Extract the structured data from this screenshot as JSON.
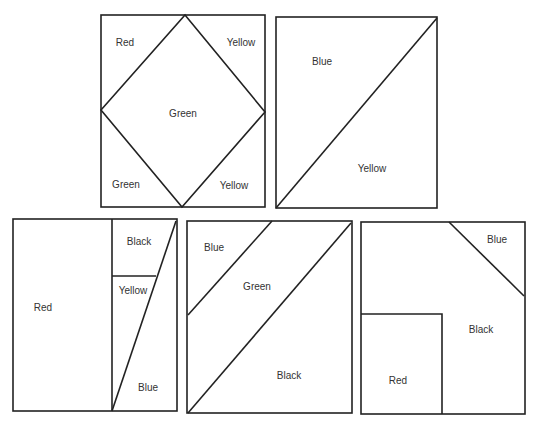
{
  "panels": [
    {
      "id": "panel-1",
      "regions": [
        {
          "label": "Red",
          "x": 125,
          "y": 42
        },
        {
          "label": "Yellow",
          "x": 241,
          "y": 42
        },
        {
          "label": "Green",
          "x": 183,
          "y": 113
        },
        {
          "label": "Green",
          "x": 126,
          "y": 184
        },
        {
          "label": "Yellow",
          "x": 234,
          "y": 185
        }
      ]
    },
    {
      "id": "panel-2",
      "regions": [
        {
          "label": "Blue",
          "x": 322,
          "y": 61
        },
        {
          "label": "Yellow",
          "x": 372,
          "y": 168
        }
      ]
    },
    {
      "id": "panel-3",
      "regions": [
        {
          "label": "Black",
          "x": 139,
          "y": 241
        },
        {
          "label": "Yellow",
          "x": 133,
          "y": 290
        },
        {
          "label": "Red",
          "x": 43,
          "y": 307
        },
        {
          "label": "Blue",
          "x": 148,
          "y": 387
        }
      ]
    },
    {
      "id": "panel-4",
      "regions": [
        {
          "label": "Blue",
          "x": 214,
          "y": 247
        },
        {
          "label": "Green",
          "x": 257,
          "y": 286
        },
        {
          "label": "Black",
          "x": 289,
          "y": 375
        }
      ]
    },
    {
      "id": "panel-5",
      "regions": [
        {
          "label": "Blue",
          "x": 497,
          "y": 239
        },
        {
          "label": "Black",
          "x": 481,
          "y": 329
        },
        {
          "label": "Red",
          "x": 398,
          "y": 380
        }
      ]
    }
  ],
  "labels": {
    "p1_red": "Red",
    "p1_yellow_top": "Yellow",
    "p1_green_center": "Green",
    "p1_green_bottom": "Green",
    "p1_yellow_bottom": "Yellow",
    "p2_blue": "Blue",
    "p2_yellow": "Yellow",
    "p3_black": "Black",
    "p3_yellow": "Yellow",
    "p3_red": "Red",
    "p3_blue": "Blue",
    "p4_blue": "Blue",
    "p4_green": "Green",
    "p4_black": "Black",
    "p5_blue": "Blue",
    "p5_black": "Black",
    "p5_red": "Red"
  }
}
